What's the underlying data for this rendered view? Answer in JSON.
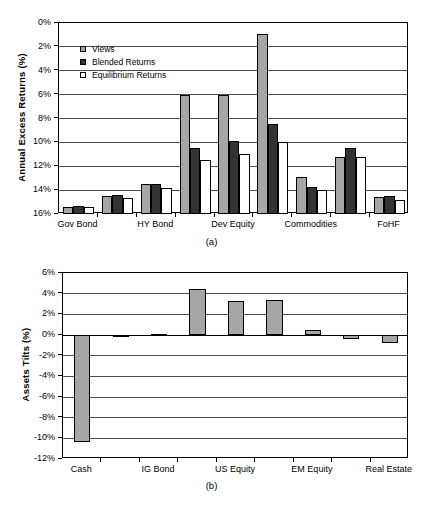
{
  "figure": {
    "panel_a_caption": "(a)",
    "panel_b_caption": "(b)"
  },
  "chart_data": [
    {
      "id": "panel-a",
      "type": "bar",
      "title": "",
      "xlabel": "",
      "ylabel": "Annual Excess Returns (%)",
      "ylim": [
        0,
        16
      ],
      "ytick_step": 2,
      "ytick_labels": [
        "0%",
        "2%",
        "4%",
        "6%",
        "8%",
        "10%",
        "12%",
        "14%",
        "16%"
      ],
      "grid": true,
      "legend_position": "upper-left-inside",
      "categories": [
        "Gov Bond",
        "",
        "HY Bond",
        "",
        "Dev Equity",
        "",
        "Commodities",
        "",
        "FoHF"
      ],
      "xtick_labels": [
        "Gov Bond",
        "HY Bond",
        "Dev Equity",
        "Commodities",
        "FoHF"
      ],
      "series": [
        {
          "name": "Views",
          "color": "#a6a6a6",
          "values": [
            0.6,
            1.5,
            2.5,
            10.0,
            10.0,
            15.1,
            3.1,
            4.8,
            1.4
          ]
        },
        {
          "name": "Blended Returns",
          "color": "#333333",
          "values": [
            0.7,
            1.55,
            2.5,
            5.55,
            6.1,
            7.55,
            2.3,
            5.5,
            1.5
          ]
        },
        {
          "name": "Equilibrium Returns",
          "color": "#ffffff",
          "values": [
            0.6,
            1.35,
            2.15,
            4.5,
            5.0,
            6.0,
            2.0,
            4.8,
            1.2
          ]
        }
      ]
    },
    {
      "id": "panel-b",
      "type": "bar",
      "title": "",
      "xlabel": "",
      "ylabel": "Assets Tilts (%)",
      "ylim": [
        -12,
        6
      ],
      "ytick_step": 2,
      "ytick_labels": [
        "6%",
        "4%",
        "2%",
        "0%",
        "-2%",
        "-4%",
        "-6%",
        "-8%",
        "-10%",
        "-12%"
      ],
      "grid": true,
      "legend_position": "none",
      "categories": [
        "Cash",
        "",
        "IG Bond",
        "",
        "US Equity",
        "",
        "EM Equity",
        "",
        "Real Estate"
      ],
      "xtick_labels": [
        "Cash",
        "IG Bond",
        "US Equity",
        "EM Equity",
        "Real Estate"
      ],
      "series": [
        {
          "name": "Assets Tilts",
          "color": "#a6a6a6",
          "values": [
            -10.4,
            -0.1,
            0.1,
            4.5,
            3.3,
            3.4,
            0.5,
            -0.35,
            -0.8
          ]
        }
      ]
    }
  ]
}
